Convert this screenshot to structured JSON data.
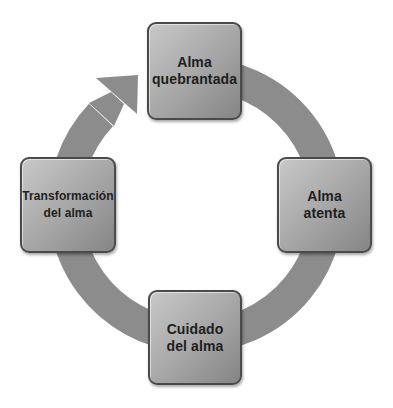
{
  "diagram": {
    "type": "cycle",
    "direction": "clockwise",
    "colors": {
      "ring": "#8c8c8c",
      "node_fill_light": "#c8c8c8",
      "node_fill_dark": "#858585",
      "node_border": "#4a4a4a",
      "label": "#1e1e1e"
    },
    "nodes": [
      {
        "id": "top",
        "label": "Alma\nquebrantada"
      },
      {
        "id": "right",
        "label": "Alma\natenta"
      },
      {
        "id": "bottom",
        "label": "Cuidado\ndel alma"
      },
      {
        "id": "left",
        "label": "Transformación\ndel alma"
      }
    ],
    "edges": [
      {
        "from": "top",
        "to": "right"
      },
      {
        "from": "right",
        "to": "bottom"
      },
      {
        "from": "bottom",
        "to": "left"
      },
      {
        "from": "left",
        "to": "top",
        "arrowhead": true
      }
    ]
  }
}
